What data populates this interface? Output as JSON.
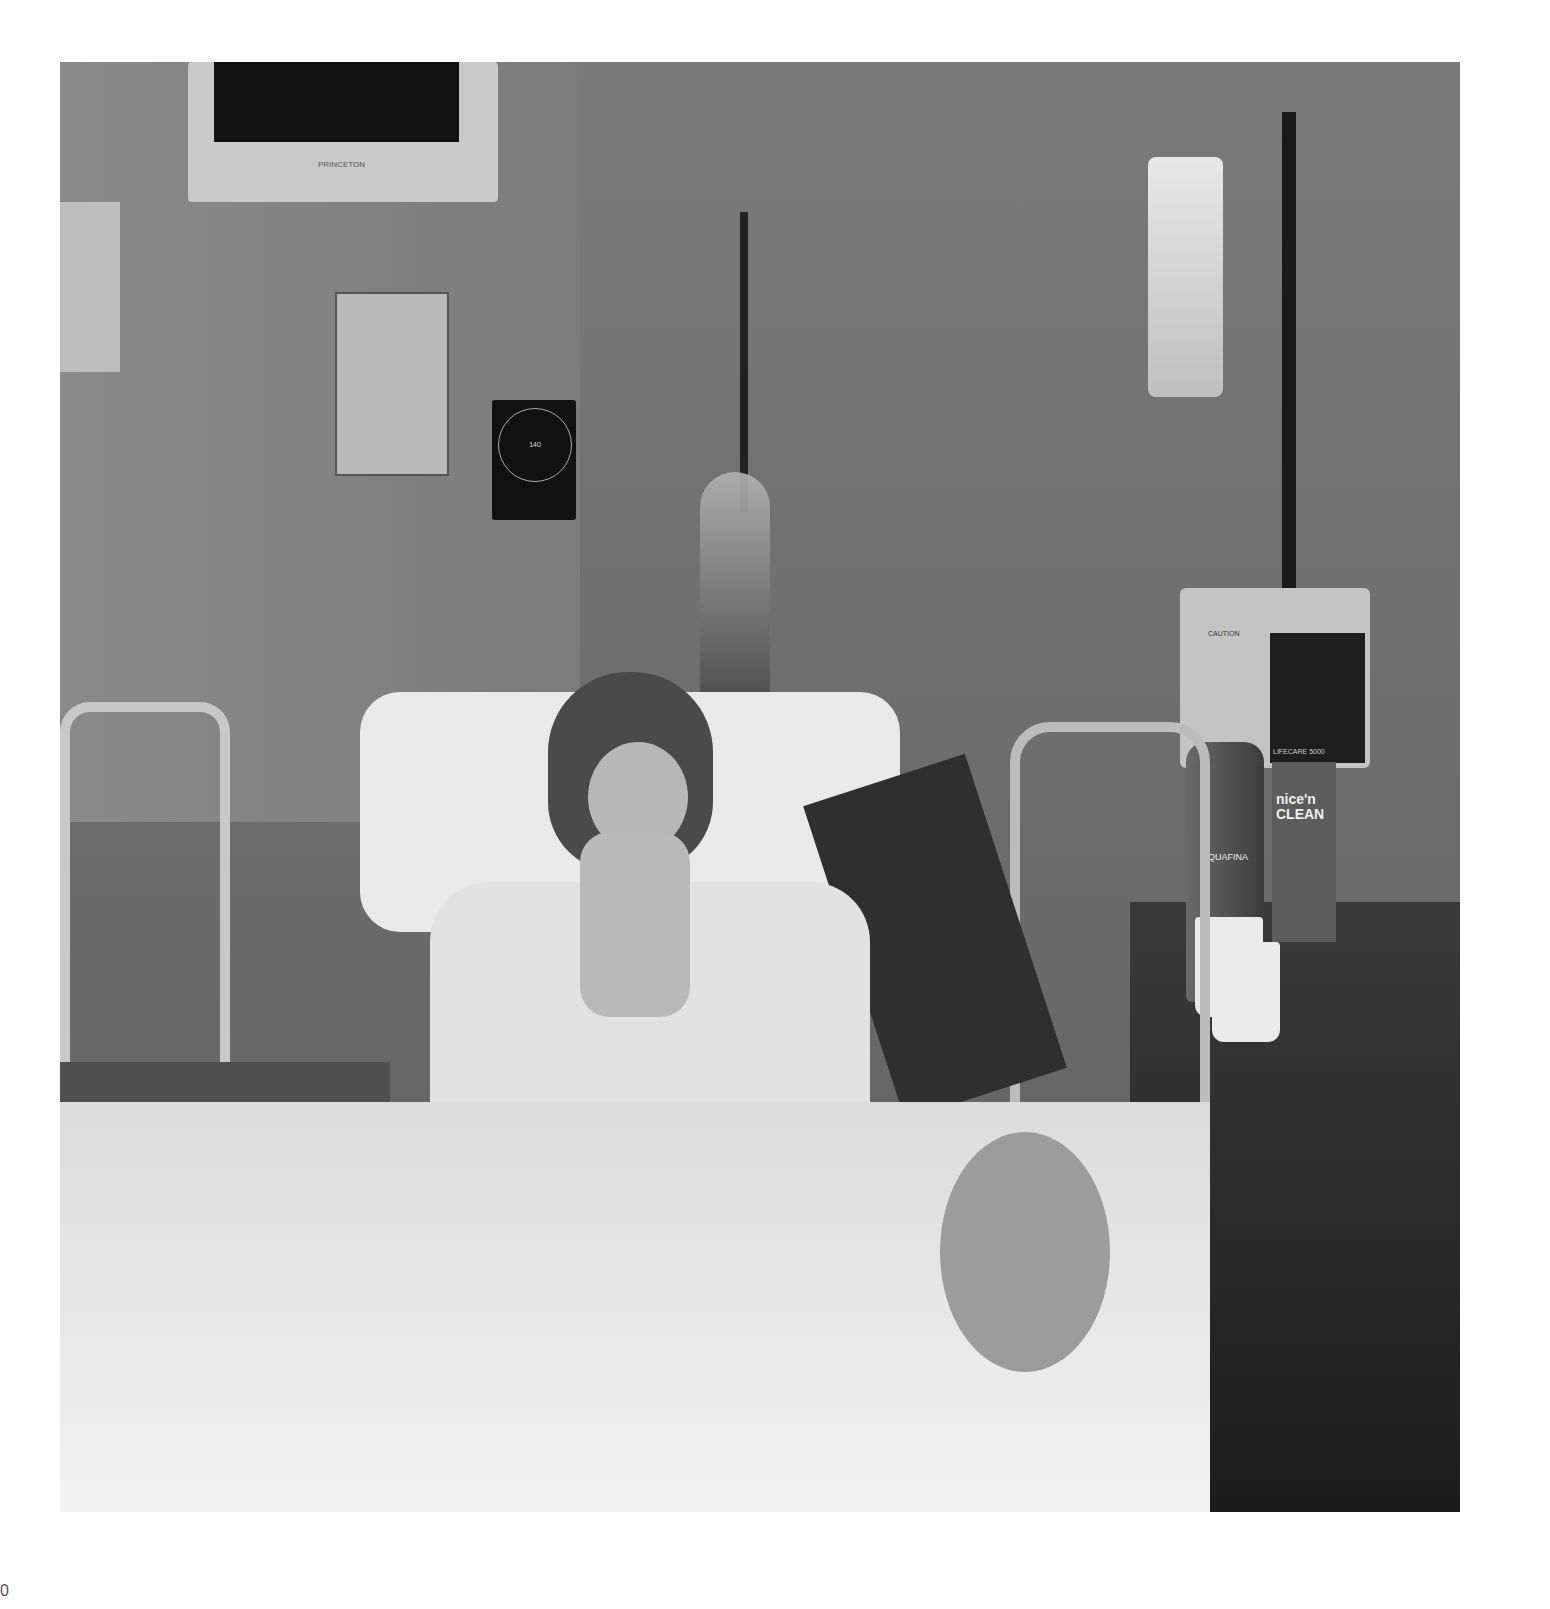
{
  "image": {
    "description": "Black-and-white photograph of a patient in a hospital bed wearing an oxygen mask with a rebreather bag, surrounded by medical equipment",
    "style": "black-and-white photograph",
    "border_color": "#ffffff"
  },
  "scene": {
    "monitor": {
      "brand_text": "PRINCETON"
    },
    "bp_gauge": {
      "scale_numbers": [
        "20",
        "40",
        "60",
        "80",
        "100",
        "120",
        "140",
        "160",
        "180",
        "200",
        "300"
      ]
    },
    "infusion_pump": {
      "caution_text": "CAUTION",
      "model_text": "LIFECARE 5000"
    },
    "water_bottle": {
      "brand_text": "AQUAFINA"
    },
    "wipes_box": {
      "brand_line1": "nice'n",
      "brand_line2": "CLEAN"
    }
  },
  "page": {
    "number_fragment": "0"
  }
}
